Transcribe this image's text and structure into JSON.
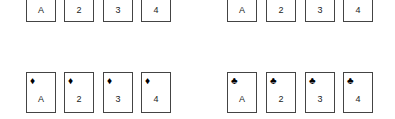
{
  "piles": [
    {
      "name": "top-left",
      "suit": "",
      "cards": [
        "A",
        "2",
        "3",
        "4"
      ]
    },
    {
      "name": "top-right",
      "suit": "",
      "cards": [
        "A",
        "2",
        "3",
        "4"
      ]
    },
    {
      "name": "bottom-left",
      "suit": "♦",
      "suit_name": "diamond",
      "cards": [
        "A",
        "2",
        "3",
        "4"
      ]
    },
    {
      "name": "bottom-right",
      "suit": "♣",
      "suit_name": "club",
      "cards": [
        "A",
        "2",
        "3",
        "4"
      ]
    }
  ]
}
